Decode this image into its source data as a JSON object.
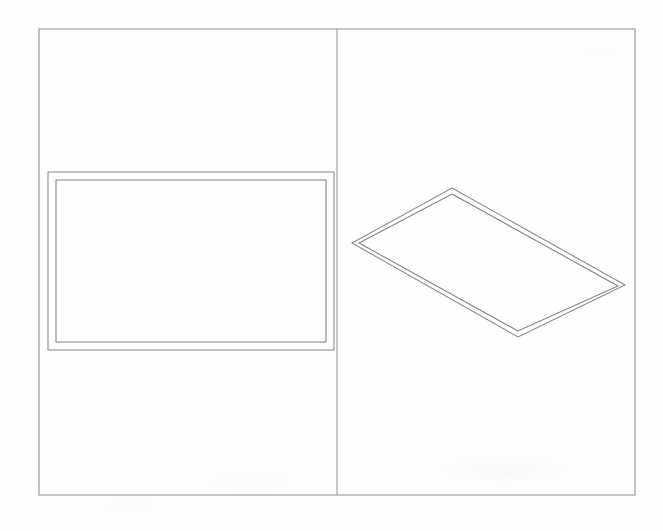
{
  "document": {
    "title": "Technical Line Drawing — Two Panel Figure",
    "media": "scanned line art",
    "background_color": "#fefefe",
    "canvas": {
      "width": 663,
      "height": 531
    }
  },
  "styles": {
    "frame_stroke_color": "#8e8e94",
    "frame_stroke_width": 1.1,
    "divider_stroke_color": "#9a9aa0",
    "divider_stroke_width": 1.1,
    "shape_outer_stroke_color": "#87878d",
    "shape_inner_stroke_color": "#7e7e85",
    "shape_stroke_width": 1.05
  },
  "frame": {
    "label": "outer page border",
    "x": 39,
    "y": 29,
    "width": 596,
    "height": 466
  },
  "divider": {
    "label": "vertical panel divider",
    "x": 337,
    "y_top": 29,
    "y_bottom": 495
  },
  "panels": [
    {
      "name": "left-panel",
      "label": "Left panel — front elevation view",
      "x": 39,
      "y": 29,
      "width": 298,
      "height": 466
    },
    {
      "name": "right-panel",
      "label": "Right panel — isometric / perspective view",
      "x": 337,
      "y": 29,
      "width": 298,
      "height": 466
    }
  ],
  "shapes": {
    "front_rectangle": {
      "label": "double-outlined rectangle (front view)",
      "outer": {
        "x": 48,
        "y": 172,
        "width": 286,
        "height": 178
      },
      "inner": {
        "x": 56,
        "y": 180,
        "width": 270,
        "height": 162
      }
    },
    "perspective_quad": {
      "label": "double-outlined rotated quadrilateral (perspective view)",
      "outer_points": "452,188 625,285 518,337 352,243",
      "inner_points": "452,194 618,286 518,331 359,243"
    }
  },
  "annotations": {
    "visible_text": [],
    "note": "No legible text, labels, numbers, or callouts are present in the drawing; only faint scanner bleed-through artifacts near the lower edge."
  }
}
